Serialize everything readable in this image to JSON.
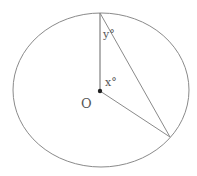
{
  "diagram": {
    "type": "circle-geometry",
    "colors": {
      "stroke": "#8a8a8a",
      "center_dot": "#222222",
      "text": "#555555"
    },
    "circle": {
      "cx": 101,
      "cy": 90,
      "rx": 88,
      "ry": 77
    },
    "points": {
      "top": {
        "x": 100,
        "y": 13
      },
      "center": {
        "x": 100,
        "y": 91
      },
      "lower_right": {
        "x": 170,
        "y": 137
      }
    },
    "labels": {
      "angle_top": "y°",
      "angle_center": "x°",
      "center_name": "O"
    }
  }
}
